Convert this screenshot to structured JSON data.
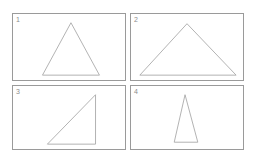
{
  "page": {
    "background_color": "#ffffff",
    "panel_border_color": "#9a9a9a",
    "shape_stroke_color": "#a8a8a8",
    "label_color": "#8d8d8d"
  },
  "panels": [
    {
      "label": "1",
      "shape_name": "triangle-isosceles-acute",
      "viewbox": "0 0 114 68",
      "points": "59,9 30,63 88,63"
    },
    {
      "label": "2",
      "shape_name": "triangle-isosceles-obtuse-wide",
      "viewbox": "0 0 114 68",
      "points": "57,10 9,63 107,63"
    },
    {
      "label": "3",
      "shape_name": "triangle-right-angle",
      "viewbox": "0 0 114 65",
      "points": "84,9 84,60 35,60"
    },
    {
      "label": "4",
      "shape_name": "triangle-isosceles-narrow-tall",
      "viewbox": "0 0 114 65",
      "points": "55,9 44,58 68,58"
    }
  ],
  "chart_data": {
    "type": "table",
    "categories": [
      "1",
      "2",
      "3",
      "4"
    ],
    "values": [
      {
        "panel": "1",
        "shape": "triangle",
        "classification": "isosceles acute",
        "apex": [
          59,
          9
        ],
        "base_left": [
          30,
          63
        ],
        "base_right": [
          88,
          63
        ],
        "base_width": 58,
        "height": 54
      },
      {
        "panel": "2",
        "shape": "triangle",
        "classification": "isosceles wide / flat",
        "apex": [
          57,
          10
        ],
        "base_left": [
          9,
          63
        ],
        "base_right": [
          107,
          63
        ],
        "base_width": 98,
        "height": 53
      },
      {
        "panel": "3",
        "shape": "triangle",
        "classification": "right angle",
        "apex": [
          84,
          9
        ],
        "base_left": [
          35,
          60
        ],
        "base_right": [
          84,
          60
        ],
        "base_width": 49,
        "height": 51
      },
      {
        "panel": "4",
        "shape": "triangle",
        "classification": "isosceles narrow / tall",
        "apex": [
          55,
          9
        ],
        "base_left": [
          44,
          58
        ],
        "base_right": [
          68,
          58
        ],
        "base_width": 24,
        "height": 49
      }
    ],
    "xlabel": "",
    "ylabel": "",
    "grid": false,
    "legend": "none"
  }
}
